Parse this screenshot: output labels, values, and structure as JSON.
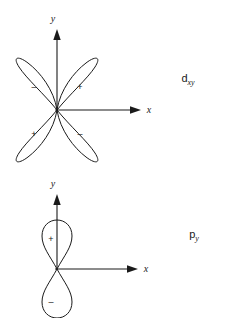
{
  "figure": {
    "background_color": "#ffffff",
    "ink_color": "#1a1a1a",
    "diagrams": [
      {
        "id": "d-orbital",
        "label_main": "d",
        "label_sub": "xy",
        "axis_x_label": "x",
        "axis_y_label": "y",
        "lobe_signs": {
          "upper_left": "–",
          "upper_right": "+",
          "lower_left": "+",
          "lower_right": "–"
        }
      },
      {
        "id": "p-orbital",
        "label_main": "p",
        "label_sub": "y",
        "axis_x_label": "x",
        "axis_y_label": "y",
        "lobe_signs": {
          "top": "+",
          "bottom": "–"
        }
      }
    ]
  }
}
